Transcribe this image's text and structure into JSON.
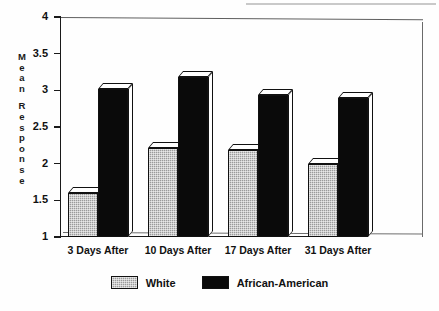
{
  "chart_data": {
    "type": "bar",
    "title": "",
    "xlabel": "",
    "ylabel": "Mean Response",
    "ylim": [
      1,
      4
    ],
    "yticks": [
      "1",
      "1.5",
      "2",
      "2.5",
      "3",
      "3.5",
      "4"
    ],
    "grid": false,
    "legend_position": "bottom-center",
    "categories": [
      "3 Days After",
      "10 Days After",
      "17 Days After",
      "31 Days After"
    ],
    "series": [
      {
        "name": "White",
        "color": "#9b9b9b",
        "values": [
          1.6,
          2.22,
          2.18,
          2.0
        ]
      },
      {
        "name": "African-American",
        "color": "#0a0a0a",
        "values": [
          3.02,
          3.18,
          2.93,
          2.9
        ]
      }
    ]
  },
  "axis": {
    "y_title_letters": [
      "M",
      "e",
      "a",
      "n",
      "",
      "R",
      "e",
      "s",
      "p",
      "o",
      "n",
      "s",
      "e"
    ]
  },
  "legend": {
    "items": [
      {
        "label": "White",
        "swatch": "gray-swatch"
      },
      {
        "label": "African-American",
        "swatch": "black-swatch"
      }
    ]
  }
}
